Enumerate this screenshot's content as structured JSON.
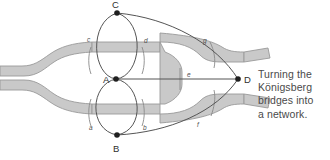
{
  "figure": {
    "caption": "Turning the Königsberg bridges into a network.",
    "caption_lines": [
      "Turning the",
      "Königsberg",
      "bridges into",
      "a network."
    ]
  },
  "colors": {
    "river_fill": "#c9c9c9",
    "river_stroke": "#9a9a9a",
    "graph_stroke": "#555555",
    "node_fill": "#1f1f1f",
    "bridge_stroke": "#8a8a8a",
    "caption_text": "#4a4a4a",
    "background": "#ffffff"
  },
  "graph": {
    "nodes": [
      {
        "id": "C",
        "label": "C",
        "x": 117,
        "y": 13,
        "label_x": 112,
        "label_y": 8
      },
      {
        "id": "A",
        "label": "A",
        "x": 116,
        "y": 79,
        "label_x": 104,
        "label_y": 82
      },
      {
        "id": "B",
        "label": "B",
        "x": 117,
        "y": 135,
        "label_x": 113,
        "label_y": 152
      },
      {
        "id": "D",
        "label": "D",
        "x": 238,
        "y": 79,
        "label_x": 244,
        "label_y": 82
      }
    ],
    "edges": [
      {
        "id": "c",
        "label": "c",
        "from": "A",
        "to": "C",
        "side": "left",
        "label_x": 89,
        "label_y": 40
      },
      {
        "id": "d",
        "label": "d",
        "from": "A",
        "to": "C",
        "side": "right",
        "label_x": 144,
        "label_y": 41
      },
      {
        "id": "a",
        "label": "a",
        "from": "A",
        "to": "B",
        "side": "left",
        "label_x": 91,
        "label_y": 128
      },
      {
        "id": "b",
        "label": "b",
        "from": "A",
        "to": "B",
        "side": "right",
        "label_x": 142,
        "label_y": 128
      },
      {
        "id": "g",
        "label": "g",
        "from": "C",
        "to": "D",
        "side": "upper",
        "label_x": 204,
        "label_y": 41
      },
      {
        "id": "e",
        "label": "e",
        "from": "A",
        "to": "D",
        "side": "straight",
        "label_x": 188,
        "label_y": 76
      },
      {
        "id": "f",
        "label": "f",
        "from": "B",
        "to": "D",
        "side": "lower",
        "label_x": 198,
        "label_y": 125
      }
    ]
  },
  "map": {
    "name": "koenigsberg-river-and-bridges",
    "bridges": [
      {
        "id": "bridge-c",
        "x": 92,
        "y1": 49,
        "y2": 72
      },
      {
        "id": "bridge-d",
        "x": 141,
        "y1": 49,
        "y2": 72
      },
      {
        "id": "bridge-a",
        "x": 92,
        "y1": 100,
        "y2": 123
      },
      {
        "id": "bridge-b",
        "x": 141,
        "y1": 100,
        "y2": 123
      },
      {
        "id": "bridge-g",
        "x": 212,
        "y1": 44,
        "y2": 66
      },
      {
        "id": "bridge-e",
        "x": 180,
        "y1": 70,
        "y2": 88
      },
      {
        "id": "bridge-f",
        "x": 213,
        "y1": 93,
        "y2": 114
      }
    ]
  }
}
